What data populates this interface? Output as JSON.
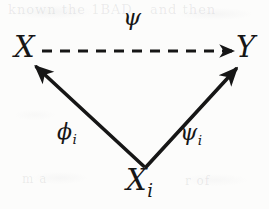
{
  "figure": {
    "type": "commutative-diagram",
    "background_color": "#fcfcfb",
    "ink_color": "#161616"
  },
  "nodes": [
    {
      "id": "X",
      "label": "X",
      "subscript": "",
      "position": "top-left"
    },
    {
      "id": "Y",
      "label": "Y",
      "subscript": "",
      "position": "top-right"
    },
    {
      "id": "Xi",
      "label": "X",
      "subscript": "i",
      "position": "bottom-center"
    }
  ],
  "edges": [
    {
      "id": "psi",
      "label": "ψ",
      "subscript": "",
      "from": "X",
      "to": "Y",
      "style": "dashed",
      "label_position": "top-center"
    },
    {
      "id": "phi_i",
      "label": "ϕ",
      "subscript": "i",
      "from": "Xi",
      "to": "X",
      "style": "solid",
      "label_position": "lower-left"
    },
    {
      "id": "psi_i",
      "label": "ψ",
      "subscript": "i",
      "from": "Xi",
      "to": "Y",
      "style": "solid",
      "label_position": "lower-right"
    }
  ],
  "ghost_marks": {
    "top_left": "known the 1BAD",
    "top_right": "and then",
    "bottom_left": "m a",
    "bottom_right": "r of"
  }
}
